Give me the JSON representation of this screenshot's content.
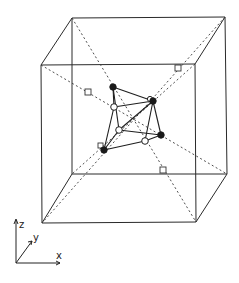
{
  "figure": {
    "type": "cubic-cell-defect-cluster",
    "colors": {
      "line": "#2a2a2a",
      "filled_atom": "#1a1a1a",
      "open_atom": "#ffffff",
      "background": "#ffffff"
    }
  },
  "cube": {
    "front_top_left": [
      41,
      65
    ],
    "front_top_right": [
      195,
      64
    ],
    "front_bottom_left": [
      42,
      223
    ],
    "front_bottom_right": [
      196,
      222
    ],
    "back_top_left": [
      72,
      18
    ],
    "back_top_right": [
      225,
      17
    ],
    "back_bottom_left": [
      72,
      174
    ],
    "back_bottom_right": [
      227,
      174
    ]
  },
  "center": [
    134,
    118
  ],
  "vacancy_markers": [
    {
      "x": 88,
      "y": 92
    },
    {
      "x": 178,
      "y": 68
    },
    {
      "x": 163,
      "y": 171
    },
    {
      "x": 101,
      "y": 146
    }
  ],
  "atoms": {
    "filled": [
      {
        "id": "A",
        "x": 113,
        "y": 87
      },
      {
        "id": "B",
        "x": 153,
        "y": 101
      },
      {
        "id": "C",
        "x": 161,
        "y": 135
      },
      {
        "id": "D",
        "x": 104,
        "y": 150
      }
    ],
    "open": [
      {
        "id": "a",
        "x": 114,
        "y": 107
      },
      {
        "id": "b",
        "x": 119,
        "y": 130
      },
      {
        "id": "c",
        "x": 145,
        "y": 141
      },
      {
        "id": "d",
        "x": 150,
        "y": 100
      }
    ]
  },
  "axes": {
    "origin": [
      16,
      263
    ],
    "labels": {
      "z": "z",
      "y": "y",
      "x": "x"
    }
  }
}
